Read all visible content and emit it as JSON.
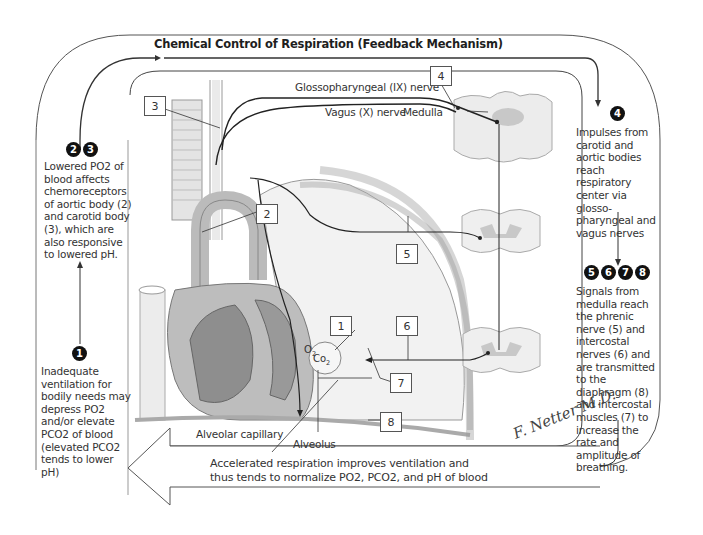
{
  "title": "Chemical Control of Respiration (Feedback Mechanism)",
  "steps": {
    "step1": {
      "badges": [
        "1"
      ],
      "text_lines": [
        "Inadequate",
        "ventilation for",
        "bodily needs may",
        "depress Po",
        "elevate Pco",
        "blood (elevated",
        "Pco",
        "lower pH)"
      ],
      "text": "Inadequate ventilation for bodily needs may depress PO2 and/or elevate PCO2 of blood (elevated PCO2 tends to lower pH)"
    },
    "step23": {
      "badges": [
        "2",
        "3"
      ],
      "text": "Lowered PO2 of blood affects chemoreceptors of aortic body (2) and carotid body (3), which are also responsive to lowered pH."
    },
    "step4": {
      "badges": [
        "4"
      ],
      "text": "Impulses from carotid and aortic bodies reach respiratory center via glosso-pharyngeal and vagus nerves"
    },
    "step5678": {
      "badges": [
        "5",
        "6",
        "7",
        "8"
      ],
      "text": "Signals from medulla reach the phrenic nerve (5) and intercostal nerves (6) and are transmitted to the diaphragm (8) and intercostal muscles (7) to increase the rate and amplitude of breathing."
    },
    "result": {
      "line1": "Accelerated respiration improves ventilation and",
      "line2": "thus tends to normalize PO2, PCO2, and pH of blood"
    }
  },
  "labels": {
    "glossopharyngeal": "Glossopharyngeal (IX) nerve",
    "vagus": "Vagus (X) nerve",
    "medulla": "Medulla",
    "alveolar_capillary": "Alveolar capillary",
    "alveolus": "Alveolus",
    "o2": "O",
    "co2": "Co"
  },
  "number_boxes": [
    "1",
    "2",
    "3",
    "4",
    "5",
    "6",
    "7",
    "8"
  ],
  "signature": "F. Netter M.D.",
  "colors": {
    "line": "#3a3a3a",
    "frame": "#555555",
    "tissue": "#e6e6e6",
    "tissue_dark": "#9a9a9a",
    "gray_matter": "#c4c4c4",
    "badge": "#111111"
  }
}
